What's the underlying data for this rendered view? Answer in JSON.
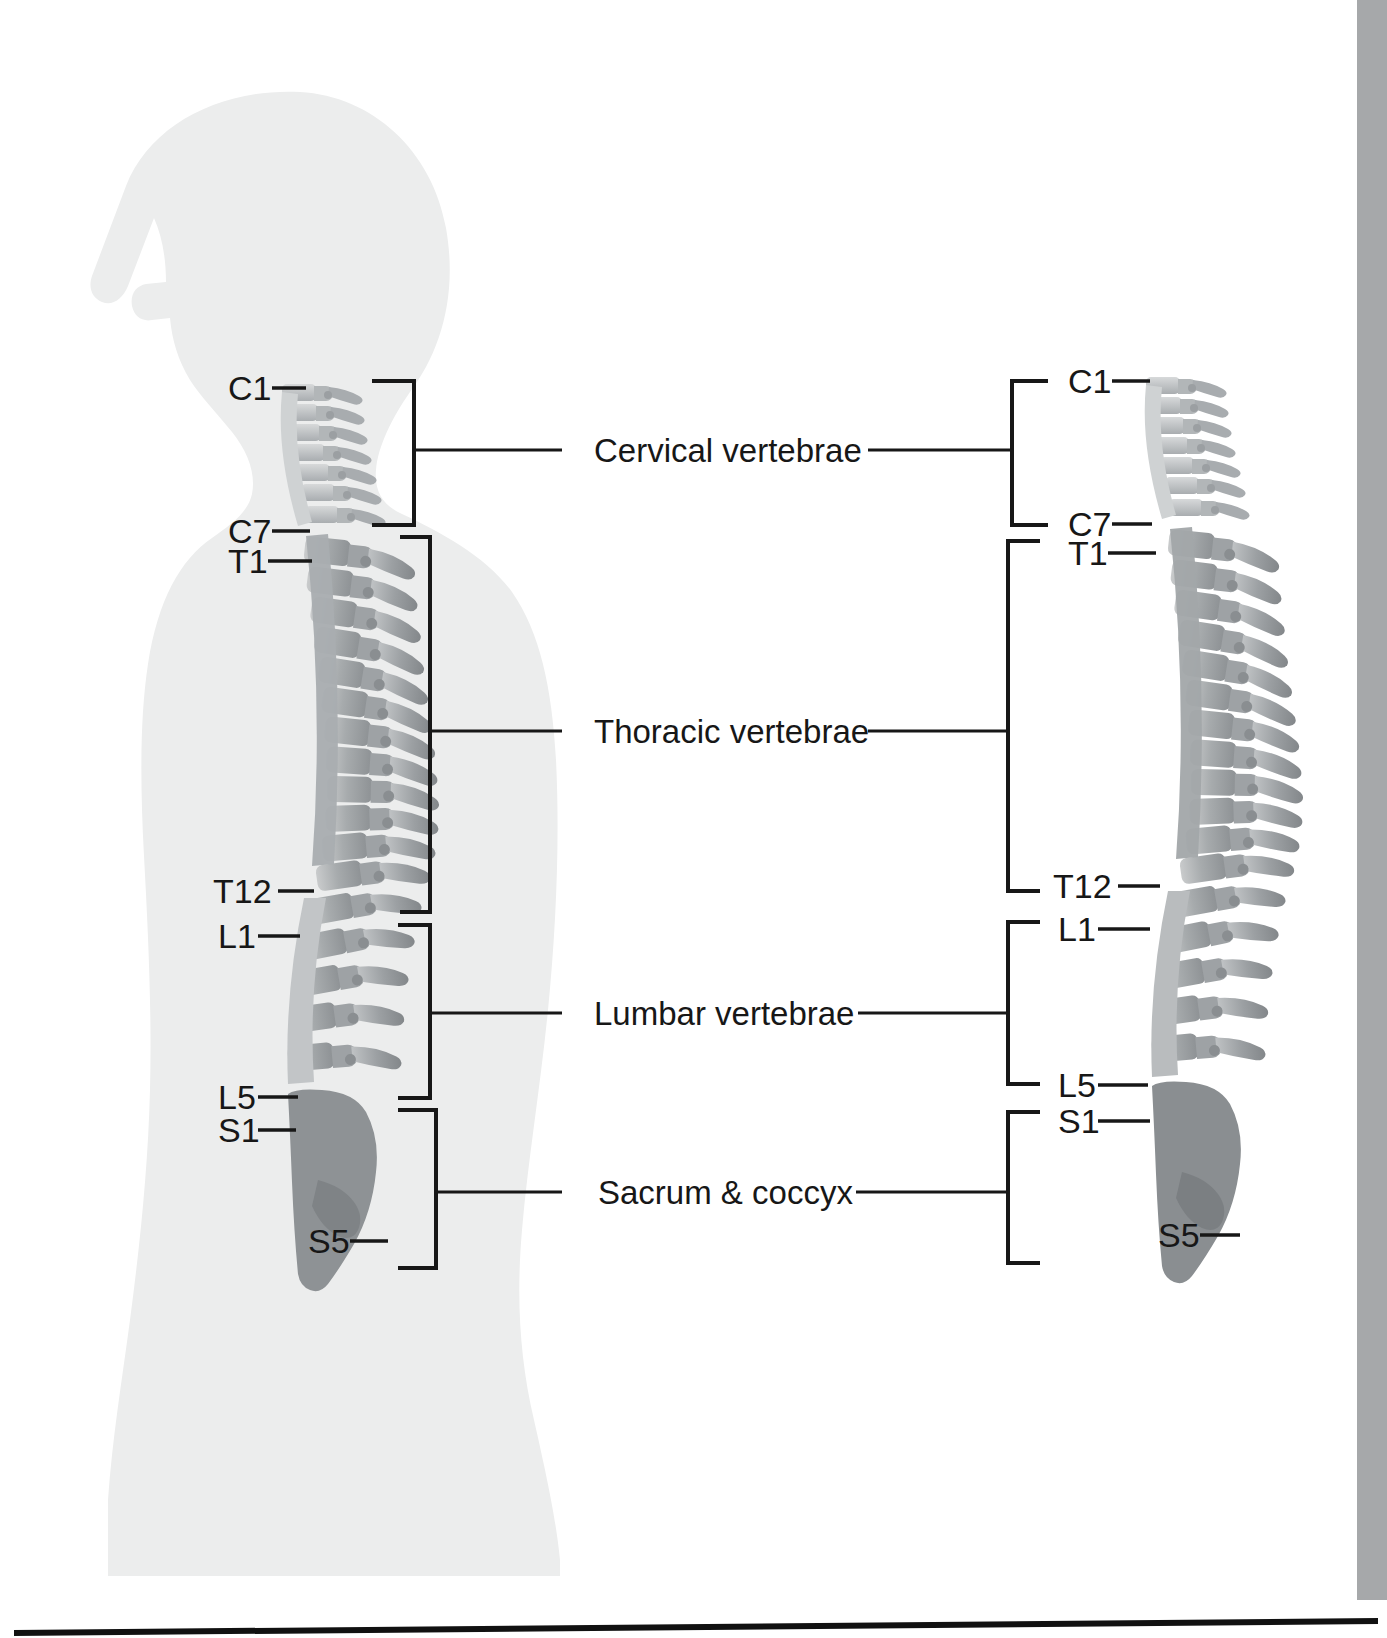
{
  "figure": {
    "background_color": "#ffffff",
    "silhouette_color": "#eceded",
    "bone_color": "#9a9ea1",
    "line_color": "#171717",
    "right_rail_color": "#a6a8aa"
  },
  "group_labels": [
    {
      "id": "cervical",
      "text": "Cervical vertebrae",
      "y": 450
    },
    {
      "id": "thoracic",
      "text": "Thoracic vertebrae",
      "y": 731
    },
    {
      "id": "lumbar",
      "text": "Lumbar vertebrae",
      "y": 1013
    },
    {
      "id": "sacrum",
      "text": "Sacrum & coccyx",
      "y": 1192
    }
  ],
  "left_figure": {
    "name": "body-silhouette-lateral-with-spine",
    "vertebra_labels": [
      {
        "id": "C1",
        "text": "C1",
        "y": 388
      },
      {
        "id": "C7",
        "text": "C7",
        "y": 531
      },
      {
        "id": "T1",
        "text": "T1",
        "y": 561
      },
      {
        "id": "T12",
        "text": "T12",
        "y": 891
      },
      {
        "id": "L1",
        "text": "L1",
        "y": 936
      },
      {
        "id": "L5",
        "text": "L5",
        "y": 1097
      },
      {
        "id": "S1",
        "text": "S1",
        "y": 1130
      },
      {
        "id": "S5",
        "text": "S5",
        "y": 1241
      }
    ]
  },
  "right_figure": {
    "name": "isolated-spine-lateral",
    "vertebra_labels": [
      {
        "id": "C1",
        "text": "C1",
        "y": 381
      },
      {
        "id": "C7",
        "text": "C7",
        "y": 524
      },
      {
        "id": "T1",
        "text": "T1",
        "y": 553
      },
      {
        "id": "T12",
        "text": "T12",
        "y": 886
      },
      {
        "id": "L1",
        "text": "L1",
        "y": 929
      },
      {
        "id": "L5",
        "text": "L5",
        "y": 1085
      },
      {
        "id": "S1",
        "text": "S1",
        "y": 1121
      },
      {
        "id": "S5",
        "text": "S5",
        "y": 1235
      }
    ]
  },
  "brackets": {
    "left": [
      {
        "id": "cervical",
        "top": 381,
        "bottom": 525
      },
      {
        "id": "thoracic",
        "top": 537,
        "bottom": 912
      },
      {
        "id": "lumbar",
        "top": 925,
        "bottom": 1098
      },
      {
        "id": "sacrum",
        "top": 1110,
        "bottom": 1268
      }
    ],
    "right": [
      {
        "id": "cervical",
        "top": 381,
        "bottom": 525
      },
      {
        "id": "thoracic",
        "top": 541,
        "bottom": 891
      },
      {
        "id": "lumbar",
        "top": 922,
        "bottom": 1084
      },
      {
        "id": "sacrum",
        "top": 1112,
        "bottom": 1263
      }
    ]
  },
  "footer_rule": {
    "name": "bottom-rule",
    "y": 1624
  }
}
